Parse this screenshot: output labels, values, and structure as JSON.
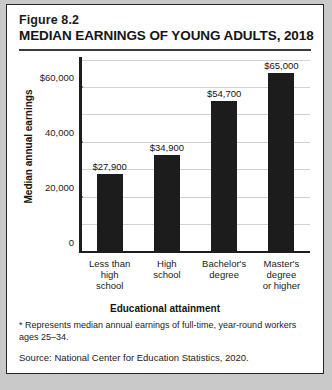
{
  "figure": {
    "number": "Figure 8.2",
    "title": "MEDIAN EARNINGS OF YOUNG ADULTS, 2018",
    "footnote": "* Represents median annual earnings of full-time, year-round workers ages 25–34.",
    "source": "Source: National Center for Education Statistics, 2020."
  },
  "chart_data": {
    "type": "bar",
    "title": "MEDIAN EARNINGS OF YOUNG ADULTS, 2018",
    "categories": [
      "Less than high school",
      "High school",
      "Bachelor's degree",
      "Master's degree or higher"
    ],
    "category_lines": [
      [
        "Less than",
        "high",
        "school"
      ],
      [
        "High",
        "school"
      ],
      [
        "Bachelor's",
        "degree"
      ],
      [
        "Master's",
        "degree",
        "or higher"
      ]
    ],
    "values": [
      27900,
      34900,
      54700,
      65000
    ],
    "value_labels": [
      "$27,900",
      "$34,900",
      "$54,700",
      "$65,000"
    ],
    "xlabel": "Educational attainment",
    "ylabel": "Median annual earnings",
    "ylim": [
      0,
      70000
    ],
    "ytick_values": [
      0,
      20000,
      40000,
      60000
    ],
    "ytick_labels": [
      "0",
      "20,000",
      "40,000",
      "$60,000"
    ],
    "gridline_values": [
      10000,
      20000,
      30000,
      40000,
      50000,
      60000,
      70000
    ],
    "grid": true,
    "legend": "none",
    "bar_color": "#1c1c1c",
    "grid_color": "#d2d2d2",
    "axis_color": "#1d1d1d"
  }
}
